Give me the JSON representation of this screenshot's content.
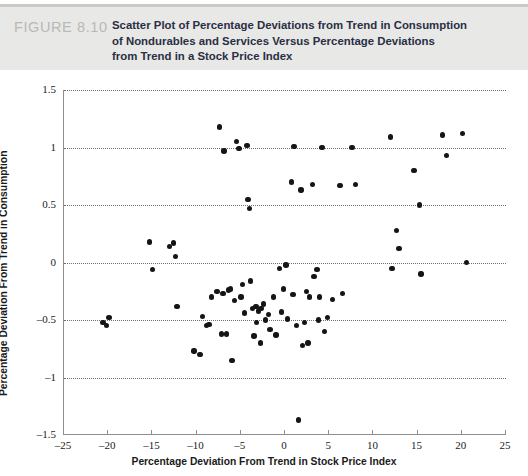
{
  "header": {
    "figure_number": "FIGURE 8.10",
    "caption_lines": [
      "Scatter Plot of Percentage Deviations from Trend in Consumption",
      "of Nondurables and Services Versus Percentage Deviations",
      "from Trend in a Stock Price Index"
    ]
  },
  "chart_data": {
    "type": "scatter",
    "title": "Scatter Plot of Percentage Deviations from Trend in Consumption of Nondurables and Services Versus Percentage Deviations from Trend in a Stock Price Index",
    "xlabel": "Percentage Deviation From Trend in Stock Price Index",
    "ylabel": "Percentage Deviation From Trend in Consumption",
    "xlim": [
      -25,
      25
    ],
    "ylim": [
      -1.5,
      1.5
    ],
    "xticks": [
      -25,
      -20,
      -15,
      -10,
      -5,
      0,
      5,
      10,
      15,
      20,
      25
    ],
    "xtick_labels": [
      "–25",
      "–20",
      "–15",
      "–10",
      "–5",
      "0",
      "5",
      "10",
      "15",
      "20",
      "25"
    ],
    "yticks": [
      -1.5,
      -1,
      -0.5,
      0,
      0.5,
      1,
      1.5
    ],
    "ytick_labels": [
      "–1.5",
      "–1",
      "–0.5",
      "0",
      "0.5",
      "1",
      "1.5"
    ],
    "grid": "horizontal-dotted",
    "legend": null,
    "marker": "filled-circle",
    "marker_color": "#151515",
    "points": [
      [
        -20.6,
        -0.52
      ],
      [
        -20.2,
        -0.55
      ],
      [
        -19.9,
        -0.48
      ],
      [
        -15.3,
        0.18
      ],
      [
        -15.0,
        -0.06
      ],
      [
        -13.1,
        0.14
      ],
      [
        -12.6,
        0.17
      ],
      [
        -12.4,
        0.05
      ],
      [
        -12.2,
        -0.38
      ],
      [
        -10.3,
        -0.77
      ],
      [
        -9.6,
        -0.8
      ],
      [
        -9.3,
        -0.47
      ],
      [
        -8.9,
        -0.55
      ],
      [
        -8.6,
        -0.54
      ],
      [
        -8.3,
        -0.3
      ],
      [
        -7.7,
        -0.25
      ],
      [
        -7.4,
        1.18
      ],
      [
        -7.2,
        -0.62
      ],
      [
        -7.0,
        -0.27
      ],
      [
        -6.9,
        0.97
      ],
      [
        -6.6,
        -0.62
      ],
      [
        -6.4,
        -0.24
      ],
      [
        -6.2,
        -0.23
      ],
      [
        -6.0,
        -0.85
      ],
      [
        -5.7,
        -0.33
      ],
      [
        -5.5,
        1.05
      ],
      [
        -5.2,
        0.99
      ],
      [
        -5.0,
        -0.3
      ],
      [
        -4.8,
        -0.19
      ],
      [
        -4.6,
        -0.44
      ],
      [
        -4.3,
        1.02
      ],
      [
        -4.2,
        0.55
      ],
      [
        -4.0,
        0.47
      ],
      [
        -3.9,
        -0.16
      ],
      [
        -3.7,
        -0.4
      ],
      [
        -3.5,
        -0.64
      ],
      [
        -3.3,
        -0.38
      ],
      [
        -3.2,
        -0.52
      ],
      [
        -3.0,
        -0.42
      ],
      [
        -2.8,
        -0.7
      ],
      [
        -2.7,
        -0.4
      ],
      [
        -2.4,
        -0.36
      ],
      [
        -2.2,
        -0.5
      ],
      [
        -1.9,
        -0.45
      ],
      [
        -1.7,
        -0.58
      ],
      [
        -1.3,
        -0.3
      ],
      [
        -1.0,
        -0.63
      ],
      [
        -0.6,
        -0.05
      ],
      [
        -0.4,
        -0.43
      ],
      [
        -0.2,
        -0.23
      ],
      [
        0.1,
        -0.02
      ],
      [
        0.3,
        -0.49
      ],
      [
        0.7,
        0.7
      ],
      [
        0.9,
        -0.28
      ],
      [
        1.0,
        1.01
      ],
      [
        1.3,
        -0.55
      ],
      [
        1.5,
        -1.37
      ],
      [
        1.8,
        0.63
      ],
      [
        2.0,
        -0.72
      ],
      [
        2.2,
        -0.52
      ],
      [
        2.4,
        -0.25
      ],
      [
        2.6,
        -0.7
      ],
      [
        2.8,
        -0.3
      ],
      [
        3.1,
        0.68
      ],
      [
        3.3,
        -0.12
      ],
      [
        3.6,
        -0.06
      ],
      [
        3.8,
        -0.5
      ],
      [
        3.9,
        -0.3
      ],
      [
        4.2,
        1.0
      ],
      [
        4.5,
        -0.6
      ],
      [
        4.8,
        -0.48
      ],
      [
        5.4,
        -0.32
      ],
      [
        6.2,
        0.67
      ],
      [
        6.5,
        -0.27
      ],
      [
        7.6,
        1.0
      ],
      [
        8.0,
        0.68
      ],
      [
        11.9,
        1.09
      ],
      [
        12.1,
        -0.05
      ],
      [
        12.6,
        0.28
      ],
      [
        12.9,
        0.12
      ],
      [
        14.6,
        0.8
      ],
      [
        15.2,
        0.5
      ],
      [
        15.4,
        -0.1
      ],
      [
        17.8,
        1.11
      ],
      [
        18.3,
        0.93
      ],
      [
        20.1,
        1.12
      ],
      [
        20.5,
        0.0
      ]
    ]
  }
}
